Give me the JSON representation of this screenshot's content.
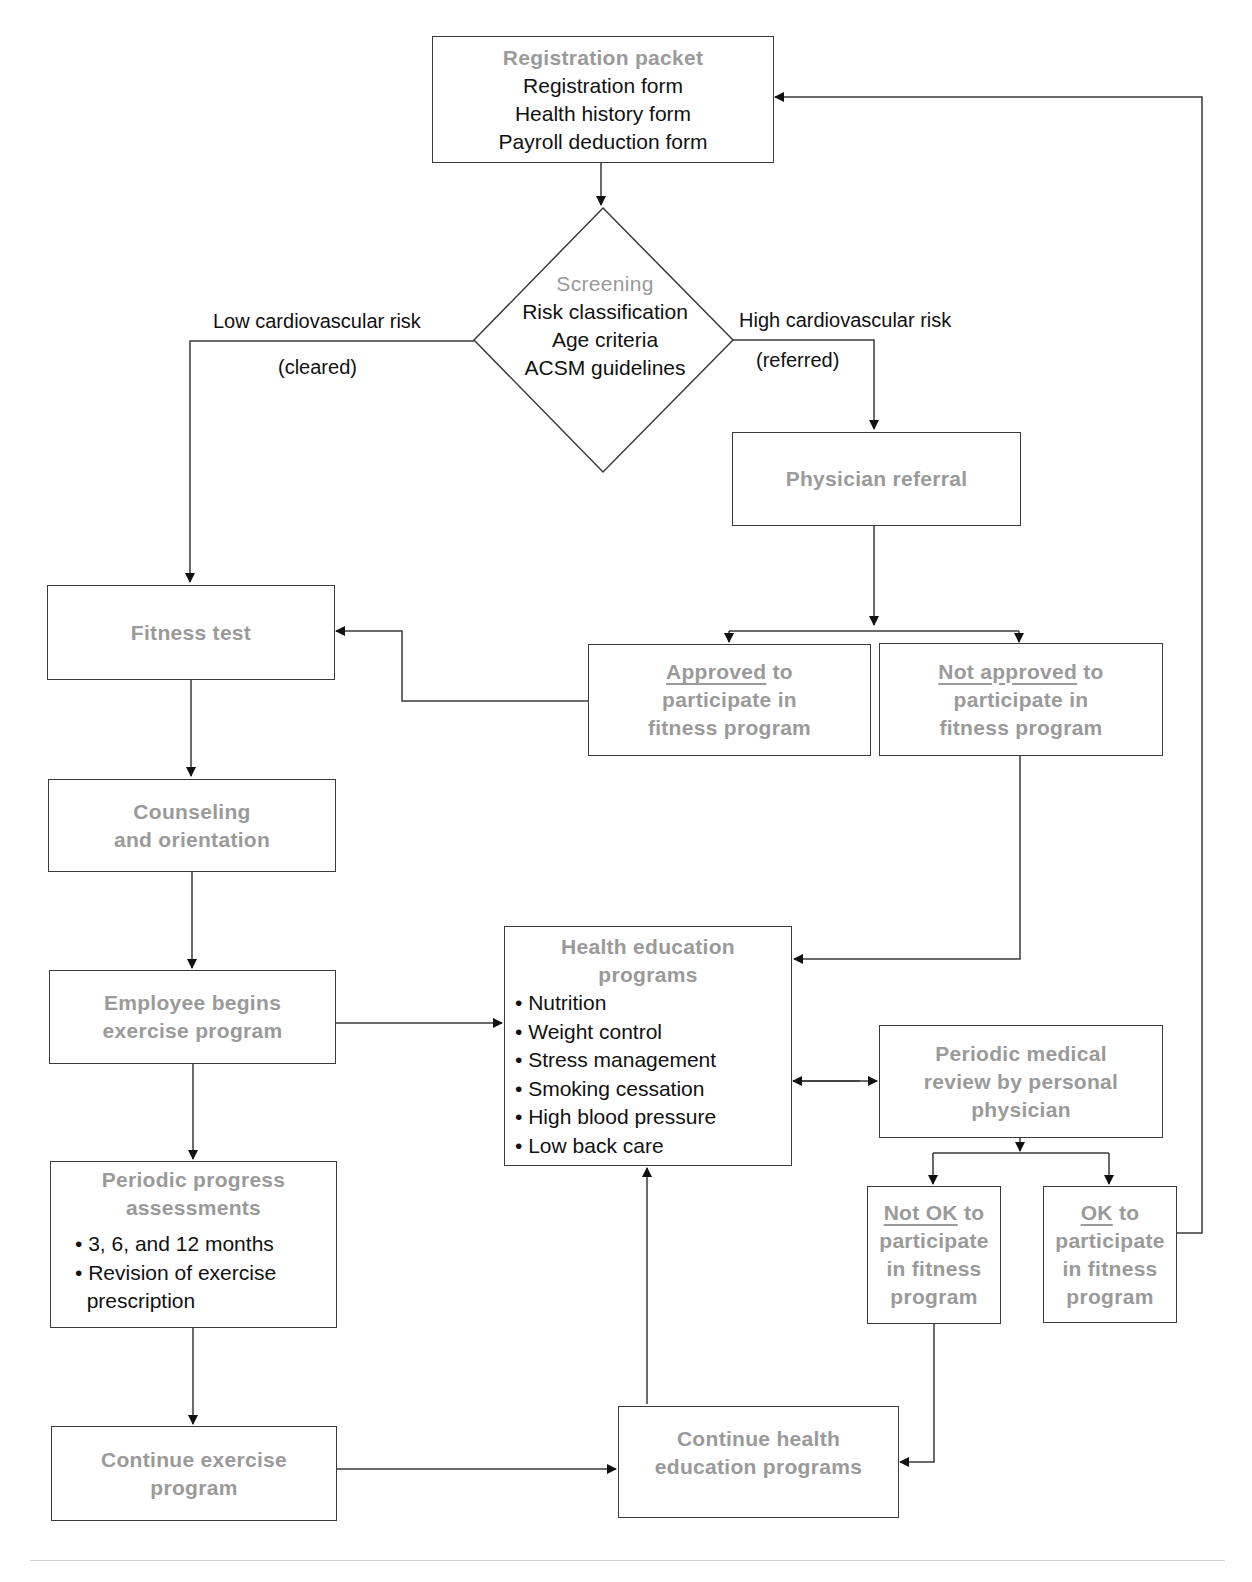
{
  "diagram": {
    "registration": {
      "title": "Registration packet",
      "lines": [
        "Registration form",
        "Health history form",
        "Payroll deduction form"
      ]
    },
    "screening": {
      "title": "Screening",
      "lines": [
        "Risk classification",
        "Age criteria",
        "ACSM guidelines"
      ]
    },
    "edges": {
      "low_risk": "Low cardiovascular risk",
      "cleared": "(cleared)",
      "high_risk": "High cardiovascular risk",
      "referred": "(referred)"
    },
    "physician_referral": {
      "title": "Physician referral"
    },
    "approved": {
      "underlined": "Approved",
      "rest1": " to",
      "line2": "participate in",
      "line3": "fitness program"
    },
    "not_approved": {
      "underlined": "Not approved",
      "rest1": " to",
      "line2": "participate in",
      "line3": "fitness program"
    },
    "fitness_test": {
      "title": "Fitness test"
    },
    "counseling": {
      "line1": "Counseling",
      "line2": "and orientation"
    },
    "employee_begins": {
      "line1": "Employee begins",
      "line2": "exercise program"
    },
    "health_education": {
      "line1": "Health education",
      "line2": "programs",
      "items": [
        "• Nutrition",
        "• Weight control",
        "• Stress management",
        "• Smoking cessation",
        "• High blood pressure",
        "• Low back care"
      ]
    },
    "periodic_review": {
      "line1": "Periodic medical",
      "line2": "review by personal",
      "line3": "physician"
    },
    "not_ok": {
      "underlined": "Not OK",
      "rest1": " to",
      "line2": "participate",
      "line3": "in fitness",
      "line4": "program"
    },
    "ok": {
      "underlined": "OK",
      "rest1": " to",
      "line2": "participate",
      "line3": "in fitness",
      "line4": "program"
    },
    "progress": {
      "line1": "Periodic progress",
      "line2": "assessments",
      "items": [
        "• 3, 6, and 12 months",
        "• Revision of exercise",
        "  prescription"
      ]
    },
    "continue_exercise": {
      "line1": "Continue exercise",
      "line2": "program"
    },
    "continue_health": {
      "line1": "Continue health",
      "line2": "education programs"
    },
    "colors": {
      "title_gray": "#9a9a9a",
      "text": "#111111",
      "line": "#3a3a3a"
    }
  }
}
